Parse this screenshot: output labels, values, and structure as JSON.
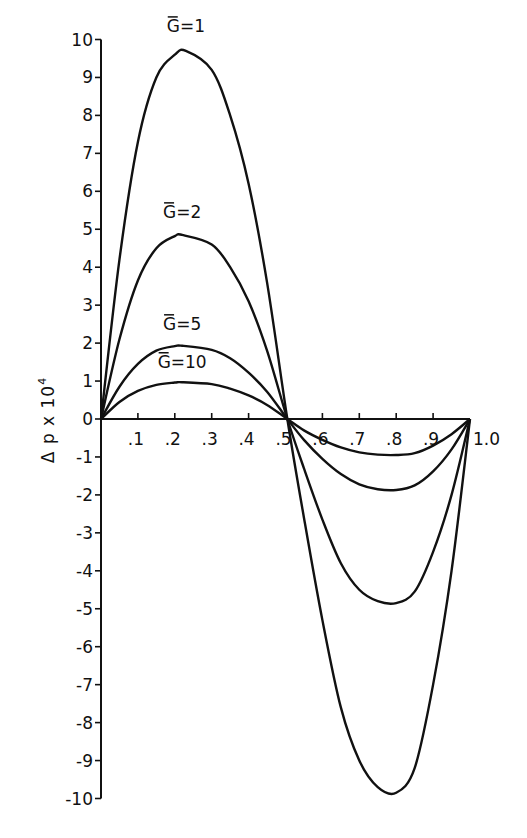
{
  "chart_data": {
    "type": "line",
    "title": "",
    "xlabel": "",
    "ylabel": "Δp x 10⁴",
    "ylabel_main": "Δ p  x 10",
    "ylabel_exp": "4",
    "xlim": [
      0,
      1.0
    ],
    "ylim": [
      -10,
      10
    ],
    "x_ticks": [
      ".1",
      ".2",
      ".3",
      ".4",
      ".5",
      ".6",
      ".7",
      ".8",
      ".9",
      "1.0"
    ],
    "y_ticks": [
      "10",
      "9",
      "8",
      "7",
      "6",
      "5",
      "4",
      "3",
      "2",
      "1",
      "0",
      "-1",
      "-2",
      "-3",
      "-4",
      "-5",
      "-6",
      "-7",
      "-8",
      "-9",
      "-10"
    ],
    "grid": false,
    "legend": "inline labels",
    "series": [
      {
        "name": "Ḡ=1",
        "label": "G=1",
        "peak": {
          "x": 0.23,
          "y": 9.7
        },
        "trough": {
          "x": 0.8,
          "y": -9.85
        },
        "x": [
          0,
          0.05,
          0.1,
          0.15,
          0.2,
          0.23,
          0.3,
          0.35,
          0.4,
          0.45,
          0.505,
          0.55,
          0.6,
          0.65,
          0.7,
          0.75,
          0.8,
          0.85,
          0.9,
          0.95,
          1.0
        ],
        "y": [
          0,
          4.2,
          7.3,
          9.0,
          9.6,
          9.7,
          9.2,
          8.0,
          6.2,
          3.6,
          0,
          -2.6,
          -5.3,
          -7.6,
          -9.0,
          -9.7,
          -9.85,
          -9.2,
          -7.0,
          -4.0,
          0
        ]
      },
      {
        "name": "Ḡ=2",
        "label": "G=2",
        "peak": {
          "x": 0.22,
          "y": 4.85
        },
        "trough": {
          "x": 0.8,
          "y": -4.85
        },
        "x": [
          0,
          0.05,
          0.1,
          0.15,
          0.2,
          0.22,
          0.3,
          0.35,
          0.4,
          0.45,
          0.505,
          0.55,
          0.6,
          0.65,
          0.7,
          0.75,
          0.8,
          0.85,
          0.9,
          0.95,
          1.0
        ],
        "y": [
          0,
          2.1,
          3.65,
          4.5,
          4.82,
          4.85,
          4.6,
          4.0,
          3.1,
          1.8,
          0,
          -1.3,
          -2.65,
          -3.8,
          -4.5,
          -4.8,
          -4.85,
          -4.55,
          -3.5,
          -2.0,
          0
        ]
      },
      {
        "name": "Ḡ=5",
        "label": "G=5",
        "peak": {
          "x": 0.22,
          "y": 1.93
        },
        "trough": {
          "x": 0.8,
          "y": -1.87
        },
        "x": [
          0,
          0.05,
          0.1,
          0.15,
          0.2,
          0.22,
          0.3,
          0.35,
          0.4,
          0.45,
          0.505,
          0.55,
          0.6,
          0.65,
          0.7,
          0.75,
          0.8,
          0.85,
          0.9,
          0.95,
          1.0
        ],
        "y": [
          0,
          0.85,
          1.45,
          1.8,
          1.92,
          1.93,
          1.82,
          1.6,
          1.22,
          0.72,
          0,
          -0.55,
          -1.05,
          -1.45,
          -1.72,
          -1.85,
          -1.87,
          -1.75,
          -1.38,
          -0.8,
          0
        ]
      },
      {
        "name": "Ḡ=10",
        "label": "G=10",
        "peak": {
          "x": 0.22,
          "y": 0.97
        },
        "trough": {
          "x": 0.8,
          "y": -0.95
        },
        "x": [
          0,
          0.05,
          0.1,
          0.15,
          0.2,
          0.22,
          0.3,
          0.35,
          0.4,
          0.45,
          0.505,
          0.55,
          0.6,
          0.65,
          0.7,
          0.75,
          0.8,
          0.85,
          0.9,
          0.95,
          1.0
        ],
        "y": [
          0,
          0.45,
          0.74,
          0.9,
          0.96,
          0.97,
          0.92,
          0.8,
          0.62,
          0.37,
          0,
          -0.3,
          -0.55,
          -0.75,
          -0.88,
          -0.94,
          -0.95,
          -0.9,
          -0.7,
          -0.4,
          0
        ]
      }
    ],
    "annotations": [
      {
        "text": "G=1",
        "x": 0.23,
        "y": 10.2
      },
      {
        "text": "G=2",
        "x": 0.22,
        "y": 5.3
      },
      {
        "text": "G=5",
        "x": 0.22,
        "y": 2.35
      },
      {
        "text": "G=10",
        "x": 0.22,
        "y": 1.35
      }
    ]
  }
}
